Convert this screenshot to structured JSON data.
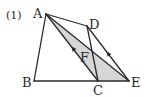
{
  "problem_number": "(1)",
  "colors": {
    "stroke": "#2a2a2a",
    "shade": "#d6d6d6",
    "background": "#ffffff"
  },
  "points": {
    "A": {
      "label": "A",
      "x": 46,
      "y": 14
    },
    "B": {
      "label": "B",
      "x": 34,
      "y": 81
    },
    "C": {
      "label": "C",
      "x": 98,
      "y": 81
    },
    "D": {
      "label": "D",
      "x": 87,
      "y": 26
    },
    "E": {
      "label": "E",
      "x": 129,
      "y": 81
    },
    "F": {
      "label": "F"
    }
  },
  "segments": [
    "AB",
    "BC",
    "CE",
    "AD",
    "DC",
    "DE",
    "AC",
    "AE"
  ],
  "shaded_region": "triangle ACE",
  "parallel_marks": [
    "AC",
    "DE"
  ]
}
